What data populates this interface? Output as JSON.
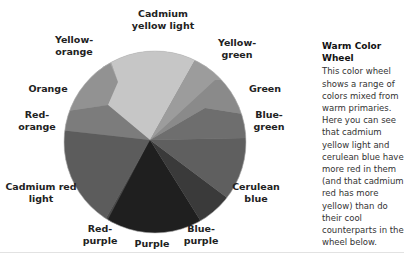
{
  "caption": {
    "title": "Warm Color Wheel",
    "body": "This color wheel shows a range of colors mixed from warm primaries. Here you can see that cadmium yellow light and cerulean blue have more red in them (and that cadmium red has more yellow) than do their cool counterparts in the wheel below."
  },
  "wheel": {
    "segments": [
      {
        "name": "Cadmium yellow light",
        "fill": "#c8c8c8"
      },
      {
        "name": "Yellow-green",
        "fill": "#9a9a9a"
      },
      {
        "name": "Green",
        "fill": "#8a8a8a"
      },
      {
        "name": "Blue-green",
        "fill": "#6e6e6e"
      },
      {
        "name": "Cerulean blue",
        "fill": "#5e5e5e"
      },
      {
        "name": "Blue-purple",
        "fill": "#3a3a3a"
      },
      {
        "name": "Purple",
        "fill": "#1e1e1e"
      },
      {
        "name": "Red-purple",
        "fill": "#4a4a4a"
      },
      {
        "name": "Cadmium red light",
        "fill": "#5a5a5a"
      },
      {
        "name": "Red-orange",
        "fill": "#7a7a7a"
      },
      {
        "name": "Orange",
        "fill": "#8e8e8e"
      },
      {
        "name": "Yellow-orange",
        "fill": "#a8a8a8"
      }
    ],
    "labels": {
      "cadmium_yellow_light": "Cadmium\nyellow light",
      "yellow_green": "Yellow-\ngreen",
      "green": "Green",
      "blue_green": "Blue-\ngreen",
      "cerulean_blue": "Cerulean\nblue",
      "blue_purple": "Blue-\npurple",
      "purple": "Purple",
      "red_purple": "Red-\npurple",
      "cadmium_red_light": "Cadmium red\nlight",
      "red_orange": "Red-\norange",
      "orange": "Orange",
      "yellow_orange": "Yellow-\norange"
    }
  }
}
